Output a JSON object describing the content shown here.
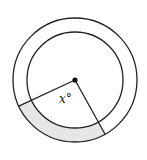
{
  "diagram": {
    "type": "annulus-sector",
    "center": {
      "x": 75,
      "y": 80
    },
    "outer_radius": 62,
    "inner_radius": 48,
    "angle_label": "x°",
    "angle_variable": "x",
    "shaded_region": "annular sector between the two radii",
    "colors": {
      "stroke": "#222222",
      "shade": "#e6e6e6",
      "background": "#ffffff"
    }
  }
}
